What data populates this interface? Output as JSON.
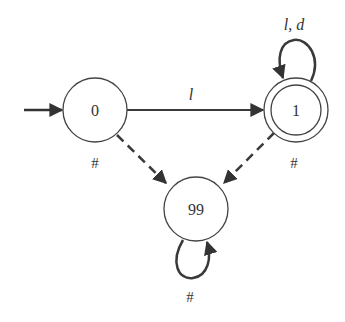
{
  "diagram": {
    "type": "finite-automaton",
    "colors": {
      "stroke": "#333333",
      "edge": "#3a3a3a",
      "background": "#ffffff"
    },
    "start_state": "0",
    "states": [
      {
        "id": "0",
        "label": "0",
        "accepting": false
      },
      {
        "id": "1",
        "label": "1",
        "accepting": true
      },
      {
        "id": "99",
        "label": "99",
        "accepting": false
      }
    ],
    "edges": [
      {
        "from": "0",
        "to": "1",
        "label": "l",
        "style": "solid"
      },
      {
        "from": "1",
        "to": "1",
        "label": "l, d",
        "style": "solid"
      },
      {
        "from": "0",
        "to": "99",
        "label": "#",
        "style": "dashed"
      },
      {
        "from": "1",
        "to": "99",
        "label": "#",
        "style": "dashed"
      },
      {
        "from": "99",
        "to": "99",
        "label": "#",
        "style": "solid"
      }
    ]
  }
}
